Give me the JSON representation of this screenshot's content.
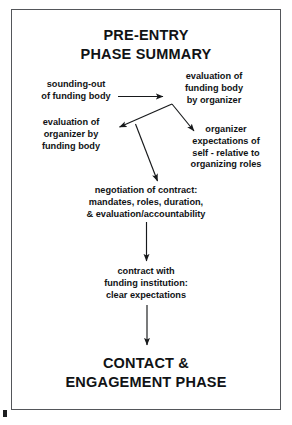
{
  "figure": {
    "title": "PRE-ENTRY\nPHASE SUMMARY",
    "footer": "CONTACT &\nENGAGEMENT PHASE",
    "frame_color": "#54565a",
    "text_color": "#111315",
    "background": "#ffffff"
  },
  "nodes": {
    "sounding_out": "sounding-out\nof funding body",
    "evaluation_of_funding_body": "evaluation of\nfunding body\nby organizer",
    "evaluation_of_organizer": "evaluation of\norganizer by\nfunding body",
    "organizer_expectations": "organizer\nexpectations of\nself - relative to\norganizing roles",
    "negotiation": "negotiation of contract:\nmandates, roles, duration,\n& evaluation/accountability",
    "contract": "contract with\nfunding institution:\nclear expectations"
  },
  "connectors": [
    {
      "name": "sounding-out-to-evaluation-of-funding-body",
      "from": "sounding_out",
      "to": "evaluation_of_funding_body",
      "style": "horizontal-right"
    },
    {
      "name": "evaluation-of-funding-body-to-evaluation-of-organizer",
      "from": "evaluation_of_funding_body",
      "to": "evaluation_of_organizer",
      "style": "diagonal-down-left"
    },
    {
      "name": "evaluation-of-funding-body-to-organizer-expectations",
      "from": "evaluation_of_funding_body",
      "to": "organizer_expectations",
      "style": "diagonal-down-right"
    },
    {
      "name": "branch-to-negotiation",
      "from": "evaluation_of_funding_body",
      "to": "negotiation",
      "style": "diagonal-down"
    },
    {
      "name": "negotiation-to-contract",
      "from": "negotiation",
      "to": "contract",
      "style": "vertical-down"
    },
    {
      "name": "contract-to-contact-engagement-phase",
      "from": "contract",
      "to": "footer",
      "style": "vertical-down"
    }
  ]
}
